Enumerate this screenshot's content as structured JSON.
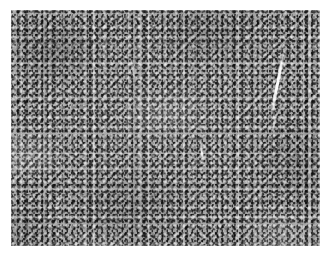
{
  "figure": {
    "kind": "histopathology-micrograph",
    "caption": "",
    "stain": "Hematoxylin and eosin (grayscale reproduction)",
    "description": "Dense, monotonous sheet of small round cells with scant cytoplasm and high nuclear-to-cytoplasmic ratio, filling the entire field without architectural landmarks.",
    "width_px": 331,
    "height_px": 257
  },
  "canvas": {
    "background_color": "#ffffff",
    "margin_left_px": 11,
    "margin_top_px": 10,
    "image_width_px": 309,
    "image_height_px": 236
  },
  "palette": {
    "paper_white": "#ffffff",
    "tissue_mid_gray": "#a8a8a8",
    "nuclei_dark_gray": "#2a2a2a",
    "cytoplasm_light_gray": "#e4e4e4",
    "artifact_white": "#ffffff",
    "darkest_cluster": "#5a5a5a",
    "lightest_stroma": "#ededed"
  },
  "texture": {
    "pattern": "fine salt-and-pepper granularity",
    "nucleus_diameter_px": "2-3",
    "cellularity": "high / densely packed",
    "tone_range": "mid-gray with dark nuclear speckle and pale interstitial highlights"
  },
  "artifacts": [
    {
      "name": "major-cleft",
      "label": "bright diagonal tissue cleft",
      "location": "upper right quadrant",
      "orientation": "runs from upper-right downward and slightly leftward"
    },
    {
      "name": "minor-cleft",
      "label": "short bright vertical cleft",
      "location": "center of field"
    }
  ],
  "regions": [
    {
      "name": "upper-left",
      "tone": "dark, hypercellular"
    },
    {
      "name": "upper-right",
      "tone": "mottled, with cleft artifact"
    },
    {
      "name": "center",
      "tone": "uniform mid-gray"
    },
    {
      "name": "lower-left",
      "tone": "slightly paler streaking"
    },
    {
      "name": "lower-right",
      "tone": "mid to dark, hypercellular"
    }
  ]
}
